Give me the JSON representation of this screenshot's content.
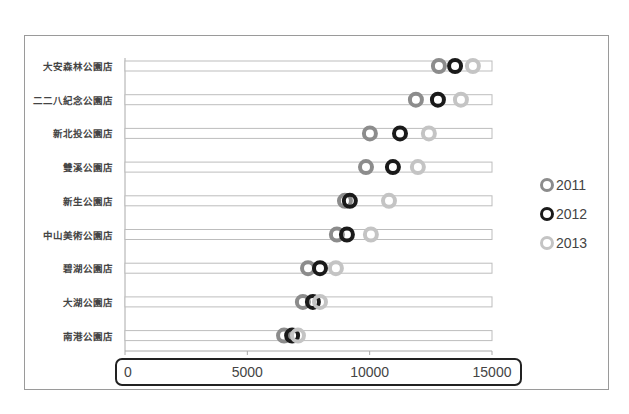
{
  "chart_data": {
    "type": "scatter",
    "subtype": "dot-plot (horizontal tracks with ring markers)",
    "title": "",
    "xlabel": "",
    "ylabel": "",
    "xlim": [
      0,
      15000
    ],
    "x_ticks": [
      0,
      5000,
      10000,
      15000
    ],
    "x_tick_labels": [
      "0",
      "5000",
      "10000",
      "15000"
    ],
    "grid": false,
    "legend_position": "right",
    "categories": [
      "大安森林公園店",
      "二二八紀念公園店",
      "新北投公園店",
      "雙溪公園店",
      "新生公園店",
      "中山美術公園店",
      "碧湖公園店",
      "大湖公園店",
      "南港公園店"
    ],
    "series": [
      {
        "name": "2011",
        "color": "#8c8c8c",
        "values": [
          12830,
          11890,
          10010,
          9850,
          8990,
          8660,
          7480,
          7270,
          6500
        ]
      },
      {
        "name": "2012",
        "color": "#1a1a1a",
        "values": [
          13490,
          12790,
          11240,
          10950,
          9190,
          9070,
          7970,
          7680,
          6830
        ]
      },
      {
        "name": "2013",
        "color": "#c4c4c4",
        "values": [
          14220,
          13730,
          12420,
          11970,
          10790,
          10050,
          8620,
          7970,
          7070
        ]
      }
    ],
    "annotations": [
      "rounded black box highlighting the x-axis tick labels"
    ]
  },
  "layout": {
    "x0_px": 125,
    "x1_px": 492,
    "row_top_px": 66,
    "row_step_px": 33.7,
    "track_height_px": 10,
    "axis_y_px": 351,
    "marker_radius_px": 8,
    "marker_stroke_px": 4
  }
}
